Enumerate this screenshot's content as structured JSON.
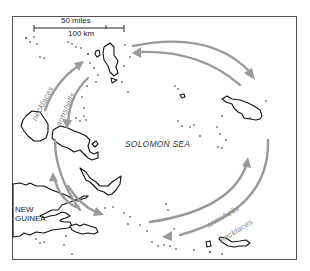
{
  "map": {
    "title": "Kula ring trade routes",
    "scale_bar": {
      "miles_label": "50 miles",
      "km_label": "100 km"
    },
    "labels": {
      "sea": "SOLOMON SEA",
      "landmass": "NEW GUINEA"
    },
    "routes": [
      {
        "name": "necklaces",
        "label": "necklaces",
        "direction": "clockwise",
        "ring": "outer",
        "color": "#9a9a9a"
      },
      {
        "name": "armshells",
        "label": "armshells",
        "direction": "counter-clockwise",
        "ring": "inner",
        "color": "#9a9a9a"
      }
    ],
    "route_label_positions": [
      {
        "route": "necklaces",
        "location": "west",
        "text": "necklaces"
      },
      {
        "route": "armshells",
        "location": "west",
        "text": "armshells"
      },
      {
        "route": "armshells",
        "location": "southeast",
        "text": "armshells"
      },
      {
        "route": "necklaces",
        "location": "southeast",
        "text": "necklaces"
      }
    ],
    "colors": {
      "coastline": "#111111",
      "route_arrows": "#9a9a9a",
      "frame": "#555555",
      "background": "#ffffff"
    }
  }
}
